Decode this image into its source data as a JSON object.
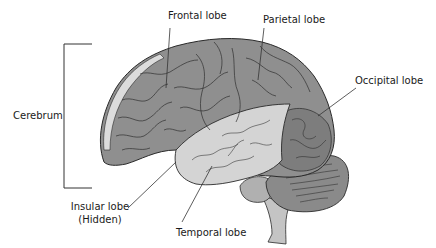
{
  "diagram": {
    "type": "anatomy-labeled-illustration",
    "labels": {
      "frontal": "Frontal lobe",
      "parietal": "Parietal lobe",
      "occipital": "Occipital lobe",
      "cerebrum": "Cerebrum",
      "insular_line1": "Insular lobe",
      "insular_line2": "(Hidden)",
      "temporal": "Temporal lobe"
    },
    "colors": {
      "cerebrum_fill": "#8f8f8f",
      "temporal_fill": "#d4d4d4",
      "cerebellum_fill": "#8a8a8a",
      "brainstem_fill": "#c4c4c4",
      "outline": "#2a2a2a",
      "meninges_fill": "#dcdcdc"
    }
  }
}
